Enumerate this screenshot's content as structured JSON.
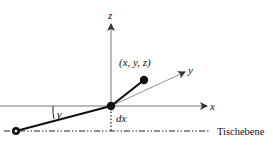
{
  "diagram": {
    "axes": {
      "x_label": "x",
      "y_label": "y",
      "z_label": "z"
    },
    "point_label": "(x, y, z)",
    "angle_label": "γ",
    "offset_label": "dx",
    "plane_label": "Tischebene",
    "colors": {
      "ink": "#111111",
      "axis": "#555555",
      "background": "#ffffff"
    }
  }
}
